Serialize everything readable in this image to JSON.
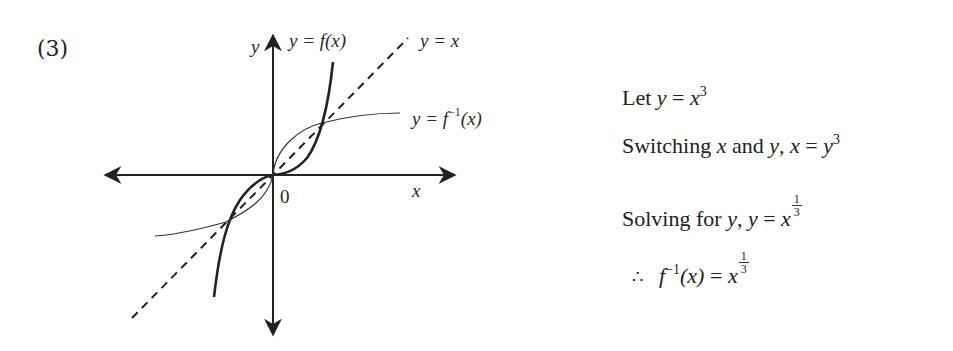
{
  "problem": {
    "number": "(3)"
  },
  "graph": {
    "axis_label_x": "x",
    "axis_label_y": "y",
    "origin_label": "0",
    "curve_f_label": "y = f(x)",
    "line_label": "y = x",
    "curve_finv_label_prefix": "y = ",
    "curve_finv_label_fn": "f",
    "curve_finv_label_exp": "−1",
    "curve_finv_label_arg": "(x)"
  },
  "solution": {
    "line1": {
      "text": "Let ",
      "lhs": "y",
      "eq": " = ",
      "base": "x",
      "exp": "3"
    },
    "line2": {
      "text": "Switching ",
      "var1": "x",
      "and": " and ",
      "var2": "y",
      "comma": ",  ",
      "lhs": "x",
      "eq": " = ",
      "base": "y",
      "exp": "3"
    },
    "line3": {
      "text": "Solving for ",
      "var": "y",
      "comma": ",  ",
      "lhs": "y",
      "eq": " = ",
      "base": "x",
      "num": "1",
      "den": "3"
    },
    "line4": {
      "therefore": "∴",
      "fn": "f",
      "exp": "−1",
      "arg": "(x)",
      "eq": " = ",
      "base": "x",
      "num": "1",
      "den": "3"
    }
  },
  "colors": {
    "ink": "#222222",
    "background": "#ffffff"
  }
}
